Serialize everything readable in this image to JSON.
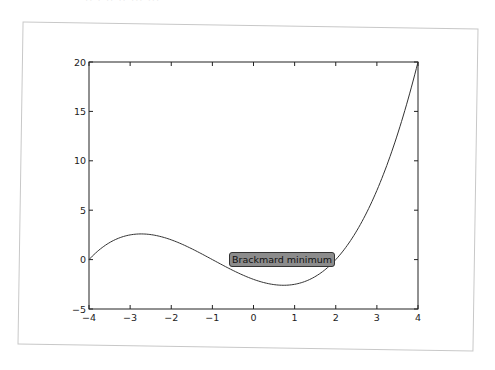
{
  "page": {
    "cut_title": "·· · ·· ·· ··· ···"
  },
  "chart_data": {
    "type": "line",
    "title": "",
    "xlabel": "",
    "ylabel": "",
    "xlim": [
      -4,
      4
    ],
    "ylim": [
      -5,
      20
    ],
    "grid": false,
    "legend": null,
    "x_ticks": [
      "−4",
      "−3",
      "−2",
      "−1",
      "0",
      "1",
      "2",
      "3",
      "4"
    ],
    "y_ticks": [
      "−5",
      "0",
      "5",
      "10",
      "15",
      "20"
    ],
    "series": [
      {
        "name": "f(x) = (x^3 + 3x^2 - 6x - 8) / 4",
        "color": "#333333",
        "x": [
          -4,
          -3.5,
          -3,
          -2.73,
          -2.5,
          -2,
          -1.5,
          -1,
          -0.5,
          0,
          0.5,
          0.73,
          1,
          1.5,
          2,
          2.5,
          3,
          3.5,
          4
        ],
        "y": [
          0,
          1.84,
          2.5,
          2.6,
          2.53,
          2.0,
          1.16,
          0.25,
          -0.59,
          -2.0,
          -2.53,
          -2.6,
          -2.5,
          -1.84,
          0,
          3.28,
          7.0,
          12.34,
          20.0
        ]
      }
    ],
    "annotations": [
      {
        "text": "Brackmard minimum",
        "x": 0.7,
        "y": 0,
        "box": true,
        "box_color": "#8c8c8c"
      }
    ]
  }
}
